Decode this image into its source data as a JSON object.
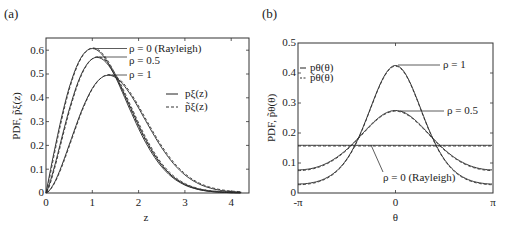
{
  "chart_data": [
    {
      "type": "line",
      "panel_label": "(a)",
      "title": "",
      "xlabel": "z",
      "ylabel": "PDF, p̃ξ(z)",
      "xlim": [
        0,
        4.2
      ],
      "ylim": [
        0,
        0.65
      ],
      "xticks": [
        "0",
        "1",
        "2",
        "3",
        "4"
      ],
      "yticks": [
        "0",
        "0.1",
        "0.2",
        "0.3",
        "0.4",
        "0.5",
        "0.6"
      ],
      "grid": false,
      "legend": {
        "position": "right-middle",
        "entries": [
          {
            "label": "pξ(z)",
            "style": "solid"
          },
          {
            "label": "p̃ξ(z)",
            "style": "dashed"
          }
        ]
      },
      "annotations": [
        "ρ = 0 (Rayleigh)",
        "ρ = 0.5",
        "ρ = 1"
      ],
      "series": [
        {
          "name": "ρ = 0 (Rayleigh)",
          "peak_x": 1.0,
          "peak_y": 0.607
        },
        {
          "name": "ρ = 0.5",
          "peak_x": 1.1,
          "peak_y": 0.57
        },
        {
          "name": "ρ = 1",
          "peak_x": 1.35,
          "peak_y": 0.495
        }
      ]
    },
    {
      "type": "line",
      "panel_label": "(b)",
      "title": "",
      "xlabel": "θ",
      "ylabel": "PDF, p̃θ(θ)",
      "xlim": [
        "-π",
        "π"
      ],
      "ylim": [
        0,
        0.5
      ],
      "xticks": [
        "-π",
        "0",
        "π"
      ],
      "yticks": [
        "0",
        "0.1",
        "0.2",
        "0.3",
        "0.4",
        "0.5"
      ],
      "grid": false,
      "legend": {
        "position": "upper-left",
        "entries": [
          {
            "label": "pθ(θ)",
            "style": "solid"
          },
          {
            "label": "p̃θ(θ)",
            "style": "dashed"
          }
        ]
      },
      "annotations": [
        "ρ = 1",
        "ρ = 0.5",
        "ρ = 0 (Rayleigh)"
      ],
      "series": [
        {
          "name": "ρ = 1",
          "value_at_0": 0.425,
          "value_at_pi": 0.03
        },
        {
          "name": "ρ = 0.5",
          "value_at_0": 0.275,
          "value_at_pi": 0.077
        },
        {
          "name": "ρ = 0 (Rayleigh)",
          "value_constant": 0.159
        }
      ]
    }
  ],
  "panels": {
    "a": {
      "label": "(a)",
      "xlabel": "z",
      "ylabel": "PDF, p̃ξ(z)",
      "xticks": [
        "0",
        "1",
        "2",
        "3",
        "4"
      ],
      "yticks": [
        "0",
        "0.1",
        "0.2",
        "0.3",
        "0.4",
        "0.5",
        "0.6"
      ],
      "ann": [
        "ρ = 0 (Rayleigh)",
        "ρ = 0.5",
        "ρ = 1"
      ],
      "legend": [
        "pξ(z)",
        "p̃ξ(z)"
      ]
    },
    "b": {
      "label": "(b)",
      "xlabel": "θ",
      "ylabel": "PDF, p̃θ(θ)",
      "xticks": [
        "-π",
        "0",
        "π"
      ],
      "yticks": [
        "0",
        "0.1",
        "0.2",
        "0.3",
        "0.4",
        "0.5"
      ],
      "ann": [
        "ρ = 1",
        "ρ = 0.5",
        "ρ = 0 (Rayleigh)"
      ],
      "legend": [
        "pθ(θ)",
        "p̃θ(θ)"
      ]
    }
  }
}
